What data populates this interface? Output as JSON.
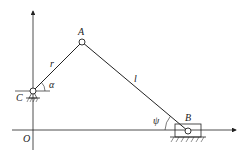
{
  "diagram": {
    "type": "slider-crank mechanism",
    "points": {
      "A": "A",
      "B": "B",
      "C": "C",
      "O": "O"
    },
    "links": {
      "crank": "r",
      "connecting_rod": "l"
    },
    "angles": {
      "crank_angle": "α",
      "rod_angle": "ψ"
    },
    "colors": {
      "line": "#222222",
      "background": "#ffffff"
    }
  }
}
